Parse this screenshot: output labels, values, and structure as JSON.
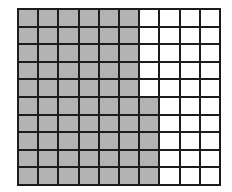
{
  "diagram": {
    "type": "hundred-grid",
    "rows": 10,
    "columns": 10,
    "shaded_columns_per_row": [
      6,
      6,
      6,
      6,
      6,
      7,
      7,
      7,
      7,
      7
    ],
    "shaded_total": 65,
    "unshaded_total": 35,
    "colors": {
      "shaded": "#b3b3b3",
      "unshaded": "#ffffff",
      "lines": "#1c1c1c"
    }
  }
}
